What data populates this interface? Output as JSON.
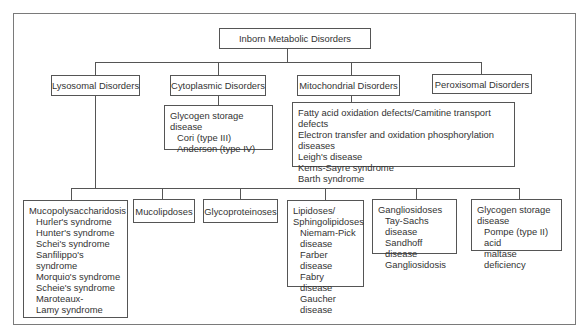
{
  "diagram": {
    "root": {
      "label": "Inborn Metabolic Disorders"
    },
    "categories": [
      {
        "label": "Lysosomal Disorders",
        "subgroups": [
          {
            "label": "Mucopolysaccharidosis",
            "items": [
              "Hurler's syndrome",
              "Hunter's syndrome",
              "Schei's syndrome",
              "Sanfilippo's syndrome",
              "Morquio's syndrome",
              "Scheie's syndrome",
              "Maroteaux-",
              "Lamy syndrome"
            ]
          },
          {
            "label": "Mucolipdoses",
            "items": []
          },
          {
            "label": "Glycoproteinoses",
            "items": []
          },
          {
            "label_lines": [
              "Lipidoses/",
              "Sphingolipidoses"
            ],
            "items": [
              "Niemam-Pick",
              "disease",
              "Farber disease",
              "Fabry disease",
              "Gaucher disease"
            ]
          },
          {
            "label": "Gangliosidoses",
            "items": [
              "Tay-Sachs disease",
              "Sandhoff disease",
              "Gangliosidosis"
            ]
          },
          {
            "label_lines": [
              "Glycogen storage",
              "disease"
            ],
            "items": [
              "Pompe (type II) acid",
              "maltase deficiency"
            ]
          }
        ]
      },
      {
        "label": "Cytoplasmic Disorders",
        "details": {
          "label": "Glycogen storage disease",
          "items": [
            "Cori (type III)",
            "Anderson (type IV)"
          ]
        }
      },
      {
        "label": "Mitochondrial Disorders",
        "details": {
          "items": [
            "Fatty acid oxidation defects/Camitine transport defects",
            "Electron transfer and oxidation phosphorylation diseases",
            "Leigh's disease",
            "Kerns-Sayre syndrome",
            "Barth syndrome"
          ]
        }
      },
      {
        "label": "Peroxisomal Disorders"
      }
    ]
  },
  "colors": {
    "line": "#555555",
    "frame": "#7a7a7a",
    "text": "#333333",
    "background": "#ffffff"
  }
}
